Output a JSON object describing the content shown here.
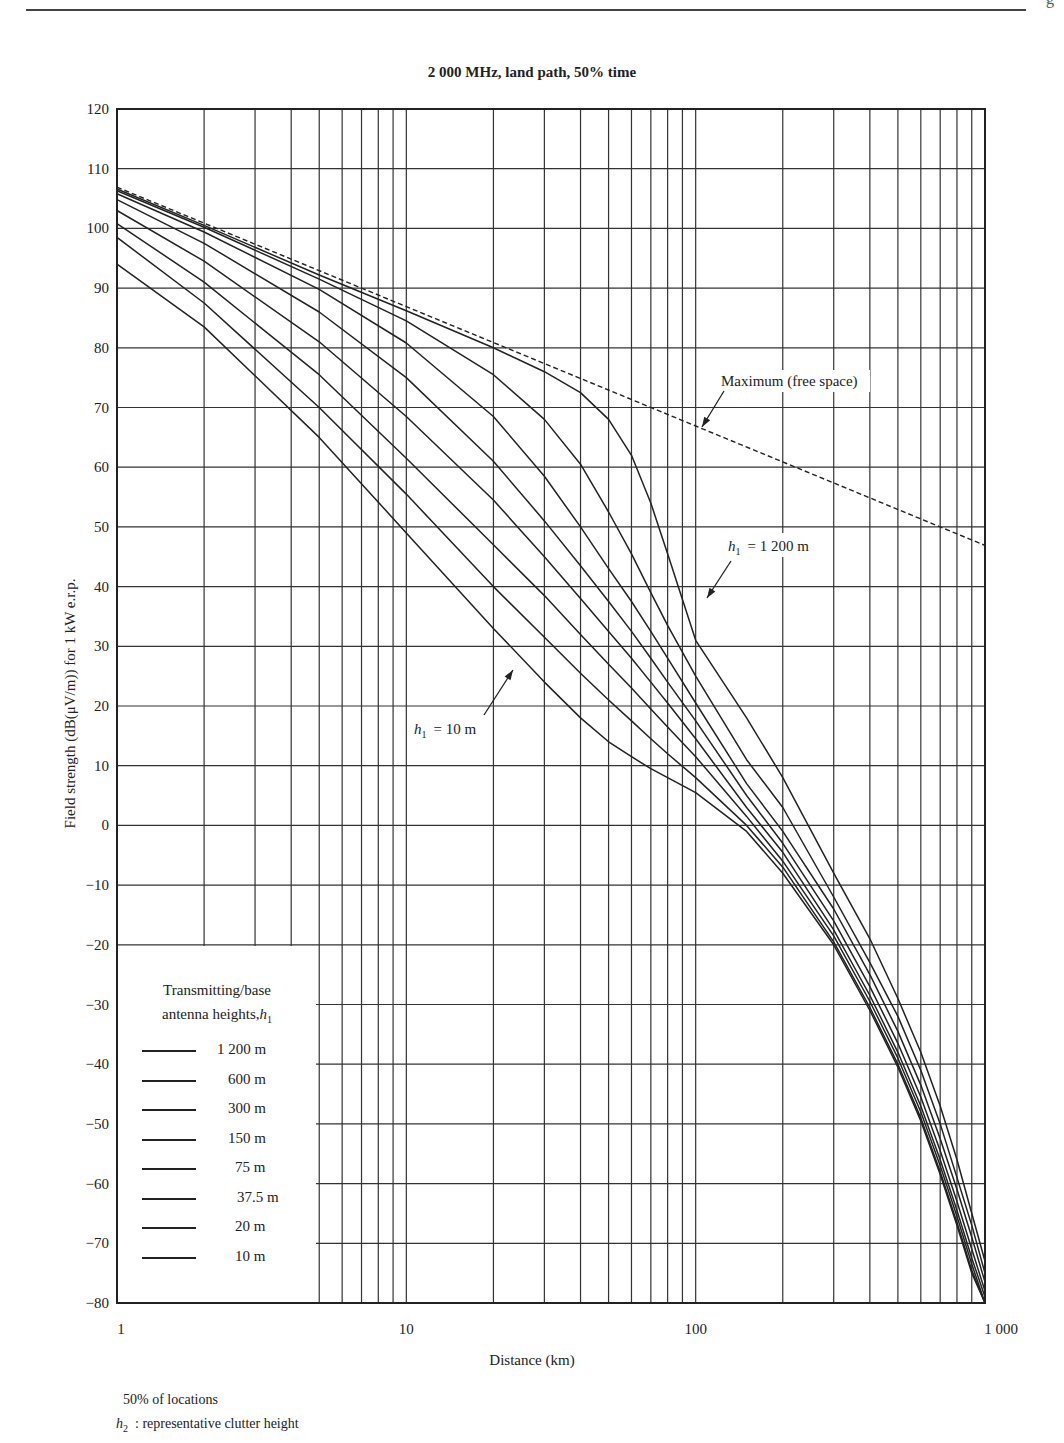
{
  "page": {
    "corner_glyph": "g",
    "notes": [
      "50% of locations",
      ": representative clutter height"
    ],
    "note_symbol": "h2"
  },
  "chart_data": {
    "type": "line",
    "title": "2 000 MHz, land path, 50% time",
    "xlabel": "Distance (km)",
    "ylabel": "Field strength (dB(μV/m)) for 1 kW e.r.p.",
    "xscale": "log",
    "xlim": [
      1,
      1000
    ],
    "ylim": [
      -80,
      120
    ],
    "xticks": [
      1,
      10,
      100,
      1000
    ],
    "xtick_labels": [
      "1",
      "10",
      "100",
      "1 000"
    ],
    "yticks": [
      120,
      110,
      100,
      90,
      80,
      70,
      60,
      50,
      40,
      30,
      20,
      10,
      0,
      -10,
      -20,
      -30,
      -40,
      -50,
      -60,
      -70,
      -80
    ],
    "grid": true,
    "x_grid_lines": [
      1,
      2,
      3,
      4,
      5,
      6,
      7,
      8,
      9,
      10,
      20,
      30,
      40,
      50,
      60,
      70,
      80,
      90,
      100,
      200,
      300,
      400,
      500,
      600,
      700,
      800,
      900,
      1000
    ],
    "legend": {
      "title_line1": "Transmitting/base",
      "title_line2": "antenna heights,",
      "title_symbol": "h1",
      "entries": [
        "1 200 m",
        "600 m",
        "300 m",
        "150 m",
        "75 m",
        "37.5 m",
        "20 m",
        "10 m"
      ],
      "position": "lower-left"
    },
    "annotations": [
      {
        "text": "Maximum (free space)",
        "target": "free-space"
      },
      {
        "text": "= 1 200 m",
        "symbol": "h1",
        "target": "1 200 m"
      },
      {
        "text": "= 10 m",
        "symbol": "h1",
        "target": "10 m"
      }
    ],
    "series": [
      {
        "name": "Maximum (free space)",
        "style": "dashed",
        "x": [
          1,
          10,
          100,
          1000
        ],
        "y": [
          106.9,
          86.9,
          66.9,
          46.9
        ]
      },
      {
        "name": "1 200 m",
        "x": [
          1,
          2,
          5,
          10,
          20,
          30,
          40,
          50,
          60,
          70,
          80,
          100,
          150,
          200,
          300,
          400,
          500,
          600,
          700,
          800,
          900,
          1000
        ],
        "y": [
          106.6,
          100.5,
          92.2,
          86.2,
          80.0,
          76.0,
          72.5,
          68.0,
          62.0,
          54.0,
          45.5,
          31.0,
          18.0,
          8.0,
          -8.0,
          -19.0,
          -29.0,
          -38.0,
          -47.0,
          -56.0,
          -65.0,
          -73.0
        ]
      },
      {
        "name": "600 m",
        "x": [
          1,
          2,
          5,
          10,
          20,
          30,
          40,
          50,
          60,
          70,
          80,
          100,
          150,
          200,
          300,
          400,
          500,
          600,
          700,
          800,
          900,
          1000
        ],
        "y": [
          106.3,
          100.2,
          91.5,
          84.5,
          75.5,
          68.0,
          60.5,
          52.5,
          45.5,
          39.0,
          33.5,
          25.0,
          11.0,
          3.0,
          -12.0,
          -23.0,
          -32.0,
          -41.0,
          -50.0,
          -59.0,
          -67.0,
          -75.0
        ]
      },
      {
        "name": "300 m",
        "x": [
          1,
          2,
          5,
          10,
          20,
          30,
          40,
          50,
          60,
          70,
          80,
          100,
          150,
          200,
          300,
          400,
          500,
          600,
          700,
          800,
          900,
          1000
        ],
        "y": [
          105.8,
          99.4,
          89.8,
          80.8,
          68.5,
          58.5,
          50.0,
          43.0,
          37.5,
          32.5,
          28.0,
          20.5,
          7.0,
          -1.0,
          -14.0,
          -25.0,
          -34.5,
          -43.5,
          -52.5,
          -61.0,
          -69.0,
          -76.5
        ]
      },
      {
        "name": "150 m",
        "x": [
          1,
          2,
          5,
          10,
          20,
          30,
          40,
          50,
          60,
          70,
          80,
          100,
          150,
          200,
          300,
          400,
          500,
          600,
          700,
          800,
          900,
          1000
        ],
        "y": [
          104.8,
          97.5,
          86.0,
          75.0,
          61.0,
          51.0,
          43.5,
          37.5,
          32.5,
          28.0,
          24.0,
          17.5,
          5.0,
          -3.0,
          -16.0,
          -27.0,
          -36.5,
          -45.5,
          -54.5,
          -63.0,
          -71.0,
          -78.0
        ]
      },
      {
        "name": "75 m",
        "x": [
          1,
          2,
          5,
          10,
          20,
          30,
          40,
          50,
          60,
          70,
          80,
          100,
          150,
          200,
          300,
          400,
          500,
          600,
          700,
          800,
          900,
          1000
        ],
        "y": [
          103.0,
          94.5,
          81.0,
          68.5,
          54.5,
          45.0,
          38.0,
          32.5,
          28.0,
          24.0,
          20.5,
          14.5,
          3.0,
          -4.5,
          -17.5,
          -28.5,
          -38.0,
          -47.0,
          -56.0,
          -64.5,
          -72.5,
          -79.0
        ]
      },
      {
        "name": "37.5 m",
        "x": [
          1,
          2,
          5,
          10,
          20,
          30,
          40,
          50,
          60,
          70,
          80,
          100,
          150,
          200,
          300,
          400,
          500,
          600,
          700,
          800,
          900,
          1000
        ],
        "y": [
          100.8,
          91.0,
          75.5,
          61.5,
          47.0,
          38.5,
          32.0,
          27.0,
          23.0,
          19.5,
          16.5,
          11.5,
          1.5,
          -6.0,
          -18.5,
          -29.5,
          -39.0,
          -48.0,
          -57.0,
          -65.5,
          -73.5,
          -80.0
        ]
      },
      {
        "name": "20 m",
        "x": [
          1,
          2,
          5,
          10,
          20,
          30,
          40,
          50,
          60,
          70,
          80,
          100,
          150,
          200,
          300,
          400,
          500,
          600,
          700,
          800,
          900,
          1000
        ],
        "y": [
          98.5,
          87.5,
          70.0,
          55.5,
          40.0,
          31.5,
          25.5,
          21.0,
          17.5,
          14.5,
          12.0,
          8.0,
          0.0,
          -7.0,
          -19.5,
          -30.5,
          -40.0,
          -49.0,
          -58.0,
          -66.5,
          -74.5,
          -81.0
        ]
      },
      {
        "name": "10 m",
        "x": [
          1,
          2,
          5,
          10,
          20,
          30,
          40,
          50,
          60,
          70,
          80,
          100,
          150,
          200,
          300,
          400,
          500,
          600,
          700,
          800,
          900,
          1000
        ],
        "y": [
          94.0,
          83.5,
          65.0,
          49.0,
          33.0,
          24.0,
          18.0,
          14.0,
          11.5,
          9.5,
          8.0,
          5.5,
          -1.0,
          -8.0,
          -20.0,
          -31.0,
          -40.5,
          -49.5,
          -58.5,
          -67.0,
          -75.0,
          -81.5
        ]
      }
    ]
  }
}
